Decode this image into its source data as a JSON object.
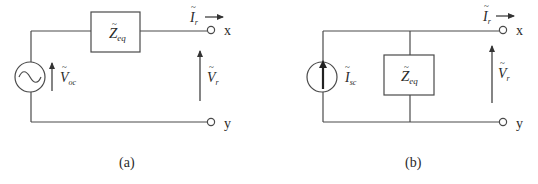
{
  "figure": {
    "type": "circuit-diagram",
    "colors": {
      "line": "#4a4a4a",
      "text": "#2a2a2a",
      "background": "#ffffff"
    }
  },
  "circuit_a": {
    "caption": "(a)",
    "source": {
      "kind": "voltage-source-ac",
      "symbol": "~",
      "label_main": "V",
      "label_sub": "oc"
    },
    "impedance": {
      "label_main": "Z",
      "label_sub": "eq",
      "connection": "series"
    },
    "current": {
      "label_main": "I",
      "label_sub": "r"
    },
    "voltage": {
      "label_main": "V",
      "label_sub": "r"
    },
    "terminals": [
      "x",
      "y"
    ]
  },
  "circuit_b": {
    "caption": "(b)",
    "source": {
      "kind": "current-source",
      "label_main": "I",
      "label_sub": "sc"
    },
    "impedance": {
      "label_main": "Z",
      "label_sub": "eq",
      "connection": "parallel"
    },
    "current": {
      "label_main": "I",
      "label_sub": "r"
    },
    "voltage": {
      "label_main": "V",
      "label_sub": "r"
    },
    "terminals": [
      "x",
      "y"
    ]
  }
}
